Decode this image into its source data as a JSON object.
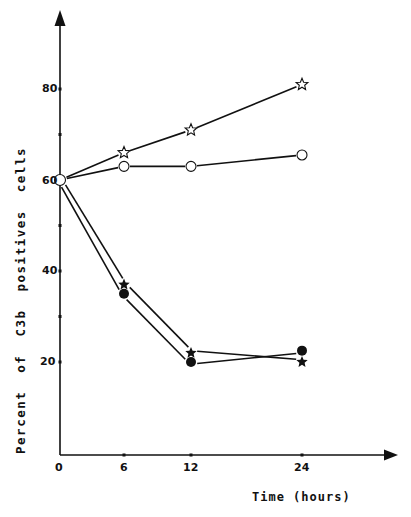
{
  "chart_data": {
    "type": "line",
    "title": "",
    "xlabel": "Time (hours)",
    "ylabel": "Percent  of  C3b  positives  cells",
    "x": [
      0,
      6,
      12,
      24
    ],
    "x_ticks": [
      "0",
      "6",
      "12",
      "24"
    ],
    "y_ticks": [
      "20",
      "40",
      "60",
      "80"
    ],
    "y_minor_ticks": [
      30,
      50,
      70
    ],
    "xlim": [
      0,
      30
    ],
    "ylim": [
      0,
      90
    ],
    "grid": false,
    "legend": "none",
    "series": [
      {
        "name": "open-star",
        "marker": "star-open",
        "values": [
          60,
          66,
          71,
          81
        ]
      },
      {
        "name": "open-circle",
        "marker": "circle-open",
        "values": [
          60,
          63,
          63,
          65.5
        ]
      },
      {
        "name": "filled-star",
        "marker": "star-filled",
        "values": [
          60,
          37,
          22,
          20
        ]
      },
      {
        "name": "filled-circle",
        "marker": "circle-filled",
        "values": [
          60,
          35,
          20,
          22.5
        ]
      }
    ]
  },
  "labels": {
    "x_axis_title": "Time (hours)",
    "y_axis_title": "Percent  of  C3b  positives  cells",
    "x0": "0",
    "x6": "6",
    "x12": "12",
    "x24": "24",
    "y20": "20",
    "y40": "40",
    "y60": "60",
    "y80": "80"
  },
  "colors": {
    "ink": "#111111",
    "background": "#ffffff"
  }
}
